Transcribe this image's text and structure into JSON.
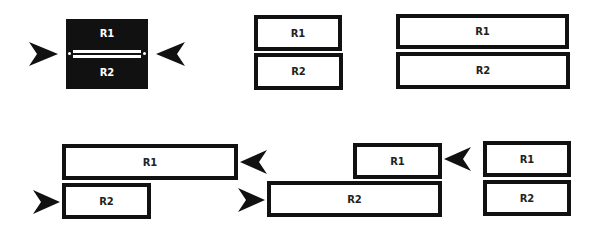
{
  "diagram": {
    "colors": {
      "stroke": "#111111",
      "fill": "#ffffff",
      "dark_fill": "#111111"
    },
    "panels": [
      {
        "id": "merged",
        "labels": [
          "R1",
          "R2"
        ],
        "arrows": [
          "right-pointing (left side)",
          "left-pointing (right side)"
        ]
      },
      {
        "id": "equal-narrow",
        "labels": [
          "R1",
          "R2"
        ]
      },
      {
        "id": "equal-wide",
        "labels": [
          "R1",
          "R2"
        ]
      },
      {
        "id": "r1-wide-r2-narrow",
        "labels": [
          "R1",
          "R2"
        ],
        "arrows": [
          "left-pointing at R1 right edge",
          "right-pointing at R2 left edge"
        ]
      },
      {
        "id": "r1-narrow-r2-wide",
        "labels": [
          "R1",
          "R2"
        ],
        "arrows": [
          "right-pointing at R2 left edge",
          "left-pointing at R1 right edge"
        ]
      },
      {
        "id": "equal-final",
        "labels": [
          "R1",
          "R2"
        ]
      }
    ],
    "labels": {
      "r1": "R1",
      "r2": "R2"
    }
  }
}
